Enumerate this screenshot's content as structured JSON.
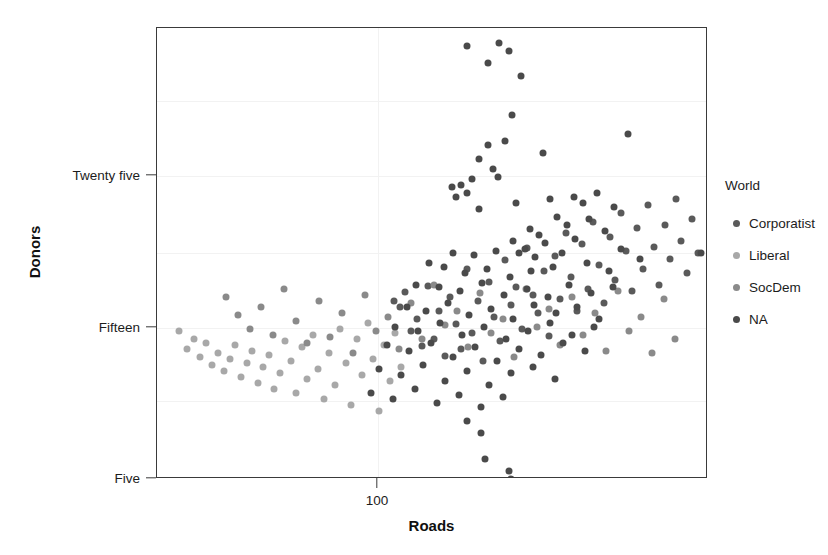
{
  "chart_data": {
    "type": "scatter",
    "title": "",
    "xlabel": "Roads",
    "ylabel": "Donors",
    "grid": true,
    "legend_position": "right",
    "x_scale": "log",
    "x_ticks": [
      {
        "label": "100",
        "value": 100,
        "px": 377
      }
    ],
    "y_ticks": [
      {
        "label": "Twenty five",
        "value": 25,
        "px": 175
      },
      {
        "label": "Fifteen",
        "value": 15,
        "px": 327
      },
      {
        "label": "Five",
        "value": 5,
        "px": 478
      }
    ],
    "gridlines_y_px": [
      100,
      175,
      252,
      327,
      400
    ],
    "gridlines_x_px": [
      377
    ],
    "xlim_px": [
      156,
      707
    ],
    "ylim_px": [
      27,
      478
    ],
    "legend": {
      "title": "World",
      "entries": [
        {
          "name": "Corporatist",
          "color": "#5a5a5a"
        },
        {
          "name": "Liberal",
          "color": "#a8a8a8"
        },
        {
          "name": "SocDem",
          "color": "#8a8a8a"
        },
        {
          "name": "NA",
          "color": "#4a4a4a"
        }
      ]
    },
    "series": [
      {
        "name": "Corporatist",
        "color": "#5a5a5a",
        "points": [
          [
            393,
            300
          ],
          [
            399,
            306
          ],
          [
            404,
            291
          ],
          [
            410,
            330
          ],
          [
            416,
            318
          ],
          [
            421,
            345
          ],
          [
            427,
            285
          ],
          [
            433,
            338
          ],
          [
            438,
            310
          ],
          [
            444,
            355
          ],
          [
            449,
            296
          ],
          [
            455,
            323
          ],
          [
            460,
            348
          ],
          [
            466,
            268
          ],
          [
            471,
            332
          ],
          [
            477,
            300
          ],
          [
            482,
            360
          ],
          [
            488,
            281
          ],
          [
            493,
            316
          ],
          [
            499,
            340
          ],
          [
            504,
            259
          ],
          [
            510,
            304
          ],
          [
            515,
            286
          ],
          [
            521,
            328
          ],
          [
            526,
            247
          ],
          [
            532,
            294
          ],
          [
            537,
            312
          ],
          [
            543,
            270
          ],
          [
            548,
            335
          ],
          [
            554,
            255
          ],
          [
            559,
            298
          ],
          [
            565,
            232
          ],
          [
            570,
            276
          ],
          [
            576,
            310
          ],
          [
            581,
            243
          ],
          [
            587,
            288
          ],
          [
            592,
            221
          ],
          [
            598,
            264
          ],
          [
            603,
            302
          ],
          [
            609,
            236
          ],
          [
            614,
            279
          ],
          [
            620,
            212
          ],
          [
            625,
            250
          ],
          [
            631,
            290
          ],
          [
            636,
            227
          ],
          [
            642,
            268
          ],
          [
            647,
            204
          ],
          [
            653,
            246
          ],
          [
            658,
            284
          ],
          [
            664,
            224
          ],
          [
            669,
            258
          ],
          [
            675,
            198
          ],
          [
            680,
            240
          ],
          [
            686,
            272
          ],
          [
            691,
            218
          ],
          [
            697,
            252
          ]
        ]
      },
      {
        "name": "Liberal",
        "color": "#a8a8a8",
        "points": [
          [
            178,
            330
          ],
          [
            186,
            348
          ],
          [
            193,
            338
          ],
          [
            199,
            356
          ],
          [
            205,
            342
          ],
          [
            211,
            364
          ],
          [
            217,
            352
          ],
          [
            223,
            370
          ],
          [
            229,
            358
          ],
          [
            234,
            344
          ],
          [
            240,
            376
          ],
          [
            246,
            362
          ],
          [
            251,
            350
          ],
          [
            257,
            382
          ],
          [
            262,
            366
          ],
          [
            268,
            354
          ],
          [
            273,
            388
          ],
          [
            279,
            372
          ],
          [
            284,
            340
          ],
          [
            290,
            360
          ],
          [
            295,
            392
          ],
          [
            301,
            346
          ],
          [
            306,
            378
          ],
          [
            312,
            334
          ],
          [
            317,
            368
          ],
          [
            323,
            398
          ],
          [
            328,
            352
          ],
          [
            334,
            384
          ],
          [
            339,
            328
          ],
          [
            345,
            362
          ],
          [
            350,
            404
          ],
          [
            356,
            338
          ],
          [
            361,
            374
          ],
          [
            367,
            322
          ],
          [
            372,
            358
          ],
          [
            378,
            410
          ],
          [
            383,
            344
          ],
          [
            389,
            380
          ],
          [
            394,
            332
          ],
          [
            400,
            366
          ]
        ]
      },
      {
        "name": "SocDem",
        "color": "#8a8a8a",
        "points": [
          [
            225,
            296
          ],
          [
            237,
            314
          ],
          [
            249,
            328
          ],
          [
            260,
            306
          ],
          [
            272,
            334
          ],
          [
            283,
            288
          ],
          [
            295,
            320
          ],
          [
            306,
            342
          ],
          [
            318,
            300
          ],
          [
            329,
            336
          ],
          [
            341,
            312
          ],
          [
            352,
            352
          ],
          [
            364,
            294
          ],
          [
            375,
            330
          ],
          [
            387,
            316
          ],
          [
            398,
            348
          ],
          [
            410,
            302
          ],
          [
            421,
            338
          ],
          [
            433,
            284
          ],
          [
            444,
            324
          ],
          [
            456,
            310
          ],
          [
            467,
            346
          ],
          [
            479,
            292
          ],
          [
            490,
            332
          ],
          [
            502,
            318
          ],
          [
            513,
            356
          ],
          [
            525,
            288
          ],
          [
            536,
            326
          ],
          [
            548,
            308
          ],
          [
            559,
            344
          ],
          [
            571,
            296
          ],
          [
            582,
            334
          ],
          [
            594,
            312
          ],
          [
            605,
            350
          ],
          [
            617,
            290
          ],
          [
            628,
            330
          ],
          [
            640,
            316
          ],
          [
            651,
            352
          ],
          [
            663,
            298
          ],
          [
            674,
            338
          ]
        ]
      },
      {
        "name": "NA",
        "color": "#4a4a4a",
        "points": [
          [
            466,
            45
          ],
          [
            498,
            42
          ],
          [
            508,
            50
          ],
          [
            487,
            62
          ],
          [
            520,
            75
          ],
          [
            511,
            114
          ],
          [
            487,
            144
          ],
          [
            504,
            140
          ],
          [
            478,
            158
          ],
          [
            492,
            168
          ],
          [
            542,
            152
          ],
          [
            627,
            133
          ],
          [
            471,
            178
          ],
          [
            497,
            176
          ],
          [
            460,
            184
          ],
          [
            451,
            186
          ],
          [
            466,
            192
          ],
          [
            455,
            196
          ],
          [
            478,
            208
          ],
          [
            515,
            202
          ],
          [
            549,
            198
          ],
          [
            573,
            196
          ],
          [
            582,
            202
          ],
          [
            596,
            192
          ],
          [
            613,
            206
          ],
          [
            556,
            216
          ],
          [
            566,
            224
          ],
          [
            588,
            218
          ],
          [
            604,
            230
          ],
          [
            529,
            228
          ],
          [
            538,
            234
          ],
          [
            512,
            240
          ],
          [
            524,
            248
          ],
          [
            544,
            242
          ],
          [
            574,
            238
          ],
          [
            452,
            252
          ],
          [
            473,
            254
          ],
          [
            495,
            250
          ],
          [
            518,
            252
          ],
          [
            534,
            256
          ],
          [
            561,
            252
          ],
          [
            620,
            248
          ],
          [
            700,
            252
          ],
          [
            428,
            262
          ],
          [
            443,
            266
          ],
          [
            464,
            272
          ],
          [
            486,
            268
          ],
          [
            509,
            276
          ],
          [
            530,
            270
          ],
          [
            552,
            266
          ],
          [
            586,
            262
          ],
          [
            608,
            270
          ],
          [
            639,
            258
          ],
          [
            415,
            284
          ],
          [
            438,
            286
          ],
          [
            459,
            290
          ],
          [
            481,
            282
          ],
          [
            503,
            294
          ],
          [
            526,
            288
          ],
          [
            547,
            296
          ],
          [
            568,
            284
          ],
          [
            590,
            292
          ],
          [
            612,
            286
          ],
          [
            406,
            306
          ],
          [
            425,
            310
          ],
          [
            447,
            302
          ],
          [
            468,
            314
          ],
          [
            490,
            308
          ],
          [
            512,
            318
          ],
          [
            533,
            304
          ],
          [
            555,
            312
          ],
          [
            576,
            306
          ],
          [
            598,
            318
          ],
          [
            394,
            326
          ],
          [
            417,
            330
          ],
          [
            439,
            322
          ],
          [
            461,
            334
          ],
          [
            483,
            326
          ],
          [
            505,
            338
          ],
          [
            527,
            330
          ],
          [
            549,
            322
          ],
          [
            571,
            334
          ],
          [
            593,
            326
          ],
          [
            386,
            344
          ],
          [
            408,
            350
          ],
          [
            430,
            342
          ],
          [
            452,
            356
          ],
          [
            474,
            346
          ],
          [
            496,
            360
          ],
          [
            518,
            348
          ],
          [
            540,
            354
          ],
          [
            562,
            342
          ],
          [
            584,
            350
          ],
          [
            378,
            368
          ],
          [
            400,
            374
          ],
          [
            422,
            364
          ],
          [
            444,
            380
          ],
          [
            466,
            370
          ],
          [
            488,
            384
          ],
          [
            510,
            372
          ],
          [
            532,
            366
          ],
          [
            554,
            378
          ],
          [
            370,
            392
          ],
          [
            392,
            398
          ],
          [
            414,
            388
          ],
          [
            436,
            402
          ],
          [
            458,
            394
          ],
          [
            480,
            406
          ],
          [
            502,
            396
          ],
          [
            480,
            432
          ],
          [
            484,
            458
          ],
          [
            508,
            470
          ],
          [
            510,
            478
          ],
          [
            466,
            420
          ]
        ]
      }
    ]
  }
}
